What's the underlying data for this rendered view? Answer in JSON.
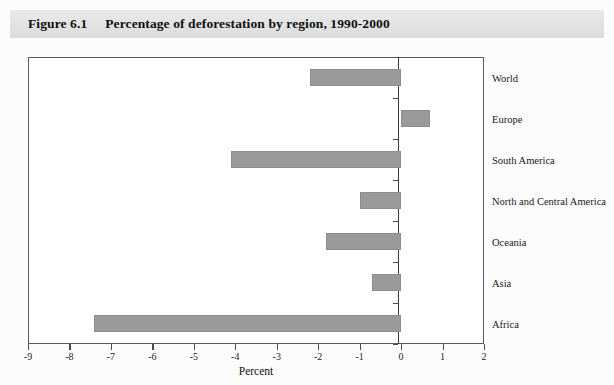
{
  "figure": {
    "number": "Figure 6.1",
    "title": "Percentage of deforestation by region, 1990-2000"
  },
  "colors": {
    "bar": "#9a9a9a",
    "header_band": "#e4e4e4",
    "frame": "#59595c",
    "axis": "#3a3a3d"
  },
  "chart_data": {
    "type": "bar",
    "orientation": "horizontal",
    "title": "Percentage of deforestation by region, 1990-2000",
    "categories": [
      "World",
      "Europe",
      "South America",
      "North and Central America",
      "Oceania",
      "Asia",
      "Africa"
    ],
    "values": [
      -2.2,
      0.7,
      -4.1,
      -1.0,
      -1.8,
      -0.7,
      -7.4
    ],
    "xlabel": "Percent",
    "ylabel": "",
    "xlim": [
      -9,
      2
    ],
    "xticks": [
      -9,
      -8,
      -7,
      -6,
      -5,
      -4,
      -3,
      -2,
      -1,
      0,
      1,
      2
    ],
    "xticklabels": [
      "-9",
      "-8",
      "-7",
      "-6",
      "-5",
      "-4",
      "-3",
      "-2",
      "-1",
      "0",
      "1",
      "2"
    ],
    "grid": false,
    "legend": null
  }
}
